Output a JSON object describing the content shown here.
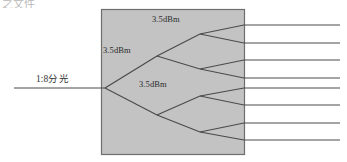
{
  "page": {
    "width": 347,
    "height": 162,
    "background_color": "#ffffff",
    "cropped_header_text": "之文件"
  },
  "diagram": {
    "title_label": "1:8分光",
    "splitter_box": {
      "x": 101,
      "y": 9,
      "width": 144,
      "height": 146,
      "fill_color": "#c3c3c3",
      "stroke_color": "#6e6e6e"
    },
    "line_color": "#4a4a4a",
    "input_line": {
      "x1": 14,
      "y1": 88,
      "x2": 101,
      "y2": 88
    },
    "power_labels": [
      {
        "id": "dbm-stage1",
        "text": "3.5dBm"
      },
      {
        "id": "dbm-stage2",
        "text": "3.5dBm"
      },
      {
        "id": "dbm-stage3",
        "text": "3.5dBm"
      }
    ],
    "nodes": {
      "root": {
        "x": 105,
        "y": 88
      },
      "stage2": [
        {
          "x": 157,
          "y": 56
        },
        {
          "x": 157,
          "y": 115
        }
      ],
      "stage3": [
        {
          "x": 200,
          "y": 34
        },
        {
          "x": 200,
          "y": 69
        },
        {
          "x": 200,
          "y": 96
        },
        {
          "x": 200,
          "y": 132
        }
      ]
    },
    "output_lines": [
      {
        "index": 1,
        "y_at_box": 25,
        "x_end": 340
      },
      {
        "index": 2,
        "y_at_box": 43,
        "x_end": 340
      },
      {
        "index": 3,
        "y_at_box": 60,
        "x_end": 340
      },
      {
        "index": 4,
        "y_at_box": 78,
        "x_end": 340
      },
      {
        "index": 5,
        "y_at_box": 88,
        "x_end": 340
      },
      {
        "index": 6,
        "y_at_box": 105,
        "x_end": 340
      },
      {
        "index": 7,
        "y_at_box": 123,
        "x_end": 340
      },
      {
        "index": 8,
        "y_at_box": 140,
        "x_end": 340
      }
    ],
    "output_count": 8
  }
}
